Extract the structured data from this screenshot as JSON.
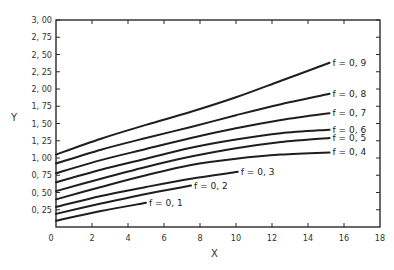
{
  "chart_data": {
    "type": "line",
    "title": "",
    "xlabel": "X",
    "ylabel": "Y",
    "xlim": [
      0,
      18
    ],
    "ylim": [
      0,
      3.0
    ],
    "grid": false,
    "legend": "inline labels at curve ends",
    "x_ticks": [
      0,
      2,
      4,
      6,
      8,
      10,
      12,
      14,
      16,
      18
    ],
    "x_tick_labels": [
      "0",
      "2",
      "4",
      "6",
      "8",
      "10",
      "12",
      "14",
      "16",
      "18"
    ],
    "y_ticks": [
      0.25,
      0.5,
      0.75,
      1.0,
      1.25,
      1.5,
      1.75,
      2.0,
      2.25,
      2.5,
      2.75,
      3.0
    ],
    "y_tick_labels": [
      "0.25",
      "0.50",
      "0.75",
      "1.00",
      "1.25",
      "1.50",
      "1.75",
      "2.00",
      "2.25",
      "2.50",
      "2.75",
      "3.00"
    ],
    "series": [
      {
        "name": "f = 0.9",
        "x": [
          0,
          2.5,
          5,
          7.5,
          10,
          12.5,
          15.2
        ],
        "y": [
          1.05,
          1.28,
          1.48,
          1.67,
          1.88,
          2.12,
          2.38
        ]
      },
      {
        "name": "f = 0.8",
        "x": [
          0,
          2.5,
          5,
          7.5,
          10,
          12.5,
          15.2
        ],
        "y": [
          0.92,
          1.12,
          1.29,
          1.45,
          1.62,
          1.78,
          1.93
        ]
      },
      {
        "name": "f = 0.7",
        "x": [
          0,
          2.5,
          5,
          7.5,
          10,
          12.5,
          15.2
        ],
        "y": [
          0.78,
          0.97,
          1.13,
          1.29,
          1.43,
          1.55,
          1.65
        ]
      },
      {
        "name": "f = 0.6",
        "x": [
          0,
          2.5,
          5,
          7.5,
          10,
          12.5,
          15.2
        ],
        "y": [
          0.65,
          0.83,
          0.99,
          1.15,
          1.27,
          1.36,
          1.41
        ]
      },
      {
        "name": "f = 0.5",
        "x": [
          0,
          2.5,
          5,
          7.5,
          10,
          12.5,
          15.2
        ],
        "y": [
          0.52,
          0.7,
          0.87,
          1.02,
          1.14,
          1.23,
          1.29
        ]
      },
      {
        "name": "f = 0.4",
        "x": [
          0,
          2.5,
          5,
          7.5,
          10,
          12.5,
          15.2
        ],
        "y": [
          0.4,
          0.58,
          0.75,
          0.9,
          0.99,
          1.05,
          1.08
        ]
      },
      {
        "name": "f = 0.3",
        "x": [
          0,
          2.5,
          5,
          7.5,
          10.1
        ],
        "y": [
          0.29,
          0.45,
          0.58,
          0.7,
          0.8
        ]
      },
      {
        "name": "f = 0.2",
        "x": [
          0,
          2.5,
          5,
          7.5
        ],
        "y": [
          0.19,
          0.34,
          0.48,
          0.6
        ]
      },
      {
        "name": "f = 0.1",
        "x": [
          0,
          2.5,
          5.0
        ],
        "y": [
          0.09,
          0.23,
          0.35
        ]
      }
    ]
  },
  "labels": {
    "x_axis_title": "X",
    "y_axis_title": "Y"
  }
}
